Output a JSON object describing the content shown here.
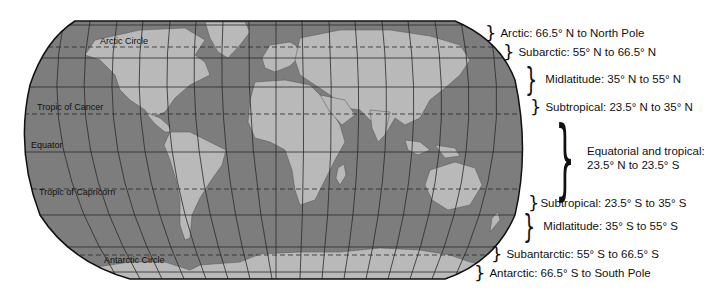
{
  "map": {
    "projection": "Robinson-style world map",
    "colors": {
      "ocean": "#7d7d7d",
      "land": "#b9b9b9",
      "grid": "#2a2a2a",
      "outline": "#111111"
    },
    "latitude_labels": {
      "arctic_circle": "Arctic Circle",
      "tropic_of_cancer": "Tropic of Cancer",
      "equator": "Equator",
      "tropic_of_capricorn": "Tropic of Capricorn",
      "antarctic_circle": "Antarctic Circle"
    }
  },
  "zones": [
    {
      "label": "Arctic: 66.5° N to North Pole"
    },
    {
      "label": "Subarctic: 55° N to 66.5° N"
    },
    {
      "label": "Midlatitude: 35° N to 55° N"
    },
    {
      "label": "Subtropical: 23.5° N to 35° N"
    },
    {
      "label_line1": "Equatorial and tropical:",
      "label_line2": "23.5° N to 23.5° S"
    },
    {
      "label": "Subtropical: 23.5° S to 35° S"
    },
    {
      "label": "Midlatitude: 35° S to 55° S"
    },
    {
      "label": "Subantarctic: 55° S to 66.5° S"
    },
    {
      "label": "Antarctic: 66.5° S to South Pole"
    }
  ]
}
